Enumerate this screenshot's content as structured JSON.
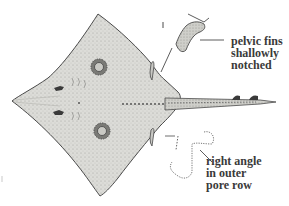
{
  "figure": {
    "colors": {
      "body_fill": "#d9d9d6",
      "outline": "#4a4a4a",
      "spot": "#6a6a66",
      "text": "#3a3a3a",
      "background": "#ffffff"
    }
  },
  "annotations": {
    "pelvic_fins": {
      "lines": [
        "pelvic fins",
        "shallowly",
        "notched"
      ]
    },
    "pore_row": {
      "lines": [
        "right angle",
        "in outer",
        "pore row"
      ]
    }
  }
}
